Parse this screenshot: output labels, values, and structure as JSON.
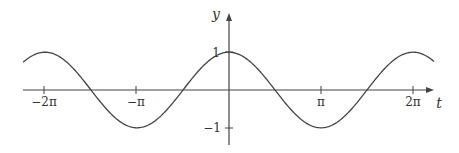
{
  "chart_data": {
    "type": "line",
    "title": "",
    "xlabel": "t",
    "ylabel": "y",
    "function": "y = cos(t)",
    "xlim": [
      -7.03,
      7.0
    ],
    "ylim": [
      -1.35,
      2.05
    ],
    "x_ticks": [
      {
        "value": -6.2832,
        "label": "−2π"
      },
      {
        "value": -3.1416,
        "label": "−π"
      },
      {
        "value": 3.1416,
        "label": "π"
      },
      {
        "value": 6.2832,
        "label": "2π"
      }
    ],
    "y_ticks": [
      {
        "value": 1,
        "label": "1"
      },
      {
        "value": -1,
        "label": "−1"
      }
    ],
    "grid": false,
    "legend": null,
    "series": [
      {
        "name": "cos(t)",
        "x": [
          -7.03,
          -6.2832,
          -5.4978,
          -4.7124,
          -3.927,
          -3.1416,
          -2.3562,
          -1.5708,
          -0.7854,
          0,
          0.7854,
          1.5708,
          2.3562,
          3.1416,
          3.927,
          4.7124,
          5.4978,
          6.2832,
          7.0
        ],
        "values": [
          0.73,
          1,
          0.707,
          0,
          -0.707,
          -1,
          -0.707,
          0,
          0.707,
          1,
          0.707,
          0,
          -0.707,
          -1,
          -0.707,
          0,
          0.707,
          1,
          0.754
        ]
      }
    ],
    "color": "#444444"
  },
  "labels": {
    "x_axis": "t",
    "y_axis": "y",
    "tick_neg_2pi": "−2π",
    "tick_neg_pi": "−π",
    "tick_pi": "π",
    "tick_2pi": "2π",
    "tick_y_1": "1",
    "tick_y_neg1": "−1"
  }
}
